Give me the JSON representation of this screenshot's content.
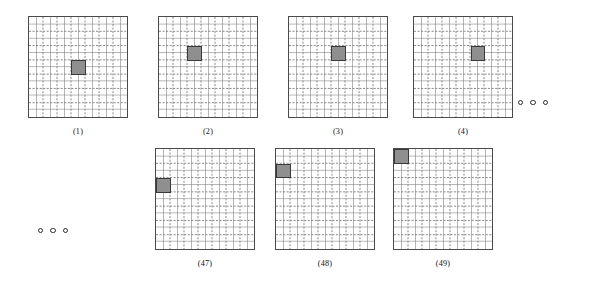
{
  "figure": {
    "caption_style": "(n)",
    "grid": {
      "major_divisions": 7,
      "minor_divisions_per_major": 2,
      "border_color": "#4a4a4a",
      "major_line_color": "#7a7a7a",
      "minor_line_color": "#787878",
      "background": "#ffffff"
    },
    "marker": {
      "fill_color": "#8f8f8f",
      "border_color": "#3a3a3a",
      "shape": "square"
    },
    "panels": [
      {
        "id": "panel-1",
        "label": "(1)",
        "x": 28,
        "y": 16,
        "marker_col": 3,
        "marker_row": 3,
        "marker_px": {
          "left": 42.0,
          "top": 43.0,
          "w": 14.5,
          "h": 14.8
        }
      },
      {
        "id": "panel-2",
        "label": "(2)",
        "x": 158,
        "y": 16,
        "marker_col": 2,
        "marker_row": 2,
        "marker_px": {
          "left": 28.0,
          "top": 29.0,
          "w": 14.5,
          "h": 14.8
        }
      },
      {
        "id": "panel-3",
        "label": "(3)",
        "x": 288,
        "y": 16,
        "marker_col": 3,
        "marker_row": 2,
        "marker_px": {
          "left": 42.0,
          "top": 29.0,
          "w": 14.5,
          "h": 14.8
        }
      },
      {
        "id": "panel-4",
        "label": "(4)",
        "x": 413,
        "y": 16,
        "marker_col": 5,
        "marker_row": 2,
        "marker_px": {
          "left": 56.5,
          "top": 29.0,
          "w": 14.5,
          "h": 14.8
        }
      },
      {
        "id": "panel-47",
        "label": "(47)",
        "x": 155,
        "y": 148,
        "marker_col": 1,
        "marker_row": 3,
        "marker_px": {
          "left": 0.0,
          "top": 29.0,
          "w": 14.5,
          "h": 14.8
        }
      },
      {
        "id": "panel-48",
        "label": "(48)",
        "x": 275,
        "y": 148,
        "marker_col": 1,
        "marker_row": 2,
        "marker_px": {
          "left": 0.0,
          "top": 14.5,
          "w": 14.5,
          "h": 14.8
        }
      },
      {
        "id": "panel-49",
        "label": "(49)",
        "x": 393,
        "y": 148,
        "marker_col": 1,
        "marker_row": 1,
        "marker_px": {
          "left": 0.0,
          "top": 0.0,
          "w": 14.5,
          "h": 14.8
        }
      }
    ],
    "ellipses": [
      {
        "id": "ellipsis-top-right",
        "x": 518,
        "y": 100,
        "dots": 3,
        "dot_style": "hollow-circle"
      },
      {
        "id": "ellipsis-bottom-left",
        "x": 38,
        "y": 228,
        "dots": 3,
        "dot_style": "hollow-circle"
      }
    ]
  }
}
